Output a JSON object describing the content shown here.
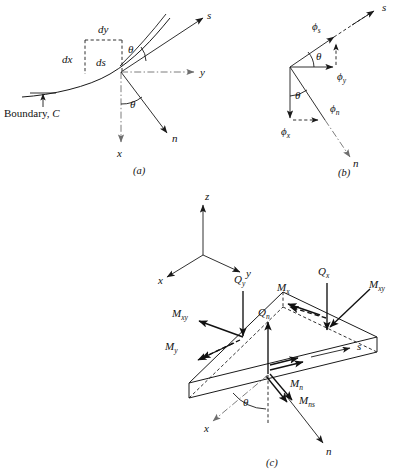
{
  "figure": {
    "background": "#ffffff",
    "ink": "#1a1a1a",
    "panels": [
      {
        "id": "a",
        "caption": "(a)",
        "description": "Boundary curve C with tangent s, normal n, and differential element ds resolved into dx and dy",
        "labels": {
          "boundary": "Boundary, C",
          "dx": "dx",
          "dy": "dy",
          "ds": "ds",
          "theta_upper": "θ",
          "theta_lower": "θ",
          "axis_s": "s",
          "axis_n": "n",
          "axis_x": "x",
          "axis_y": "y"
        }
      },
      {
        "id": "b",
        "caption": "(b)",
        "description": "Resolution of rotations phi into s, n, x and y components",
        "labels": {
          "phi_s": "ϕ",
          "phi_s_sub": "s",
          "phi_y": "ϕ",
          "phi_y_sub": "y",
          "phi_n": "ϕ",
          "phi_n_sub": "n",
          "phi_x": "ϕ",
          "phi_x_sub": "x",
          "theta_upper": "θ",
          "theta_lower": "θ",
          "axis_s": "s",
          "axis_n": "n"
        }
      },
      {
        "id": "c",
        "caption": "(c)",
        "description": "Triangular plate wedge element showing shear forces and bending/twisting moments on cartesian and boundary faces",
        "labels": {
          "triad_z": "z",
          "triad_y": "y",
          "triad_x": "x",
          "Q_y": "Q",
          "Q_y_sub": "y",
          "Q_x": "Q",
          "Q_x_sub": "x",
          "Q_n": "Q",
          "Q_n_sub": "n",
          "M_x": "M",
          "M_x_sub": "x",
          "M_y": "M",
          "M_y_sub": "y",
          "M_xy_left": "M",
          "M_xy_left_sub": "xy",
          "M_xy_right": "M",
          "M_xy_right_sub": "xy",
          "M_n": "M",
          "M_n_sub": "n",
          "M_ns": "M",
          "M_ns_sub": "ns",
          "axis_s": "s",
          "axis_n": "n",
          "axis_x": "x",
          "theta": "θ"
        }
      }
    ]
  }
}
